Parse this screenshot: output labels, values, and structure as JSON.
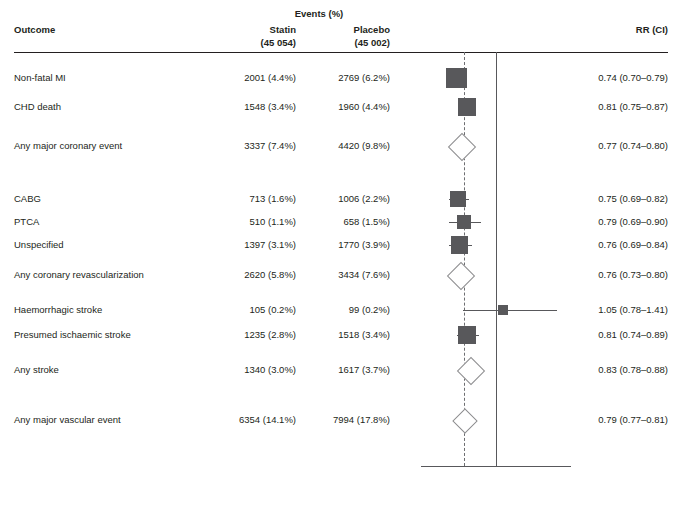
{
  "header": {
    "events_group": "Events (%)",
    "outcome_col": "Outcome",
    "statin_col": "Statin",
    "statin_n": "(45 054)",
    "placebo_col": "Placebo",
    "placebo_n": "(45 002)",
    "rr_col": "RR (CI)"
  },
  "axis": {
    "ticks": [
      "0.5",
      "1.0",
      "1.5"
    ],
    "tick_values": [
      0.5,
      1.0,
      1.5
    ],
    "minor_tick_values": [
      0.75,
      1.25
    ],
    "left_label_line1": "Statin",
    "left_label_line2": "better",
    "right_label_line1": "Placebo",
    "right_label_line2": "better",
    "effect_prefix": "Effect ",
    "effect_p": "P",
    "effect_value": " < 0.0001"
  },
  "colors": {
    "marker": "#58585b",
    "diamond_stroke": "#8c8c8e",
    "reference_line": "#58585b",
    "dashed_line": "#6d6e71",
    "text": "#231f20"
  },
  "chart_data": {
    "type": "forest",
    "title": "Events (%)",
    "xlabel": "",
    "ylabel": "",
    "xlim": [
      0.5,
      1.5
    ],
    "xscale": "linear",
    "reference_line": 1.0,
    "pooled_line": 0.79,
    "grid": false,
    "legend": "none",
    "columns": [
      "Outcome",
      "Statin (45 054)",
      "Placebo (45 002)",
      "RR (CI)"
    ],
    "rows": [
      {
        "outcome": "Non-fatal MI",
        "statin": "2001 (4.4%)",
        "placebo": "2769 (6.2%)",
        "rr_text": "0.74 (0.70–0.79)",
        "rr": 0.74,
        "lo": 0.7,
        "hi": 0.79,
        "marker": "square",
        "weight": 10,
        "y": 78
      },
      {
        "outcome": "CHD death",
        "statin": "1548 (3.4%)",
        "placebo": "1960 (4.4%)",
        "rr_text": "0.81 (0.75–0.87)",
        "rr": 0.81,
        "lo": 0.75,
        "hi": 0.87,
        "marker": "square",
        "weight": 8,
        "y": 107
      },
      {
        "outcome": "Any major coronary event",
        "statin": "3337 (7.4%)",
        "placebo": "4420 (9.8%)",
        "rr_text": "0.77 (0.74–0.80)",
        "rr": 0.77,
        "lo": 0.74,
        "hi": 0.8,
        "marker": "diamond",
        "weight": 0,
        "y": 146
      },
      {
        "outcome": "CABG",
        "statin": "713 (1.6%)",
        "placebo": "1006 (2.2%)",
        "rr_text": "0.75 (0.69–0.82)",
        "rr": 0.75,
        "lo": 0.69,
        "hi": 0.82,
        "marker": "square",
        "weight": 7,
        "y": 199
      },
      {
        "outcome": "PTCA",
        "statin": "510 (1.1%)",
        "placebo": "658 (1.5%)",
        "rr_text": "0.79 (0.69–0.90)",
        "rr": 0.79,
        "lo": 0.69,
        "hi": 0.9,
        "marker": "square",
        "weight": 5,
        "y": 222
      },
      {
        "outcome": "Unspecified",
        "statin": "1397 (3.1%)",
        "placebo": "1770 (3.9%)",
        "rr_text": "0.76 (0.69–0.84)",
        "rr": 0.76,
        "lo": 0.69,
        "hi": 0.84,
        "marker": "square",
        "weight": 8,
        "y": 245
      },
      {
        "outcome": "Any coronary revascularization",
        "statin": "2620 (5.8%)",
        "placebo": "3434 (7.6%)",
        "rr_text": "0.76 (0.73–0.80)",
        "rr": 0.76,
        "lo": 0.73,
        "hi": 0.8,
        "marker": "diamond",
        "weight": 0,
        "y": 275
      },
      {
        "outcome": "Haemorrhagic stroke",
        "statin": "105 (0.2%)",
        "placebo": "99 (0.2%)",
        "rr_text": "1.05 (0.78–1.41)",
        "rr": 1.05,
        "lo": 0.78,
        "hi": 1.41,
        "marker": "square",
        "weight": 3,
        "y": 310
      },
      {
        "outcome": "Presumed ischaemic stroke",
        "statin": "1235 (2.8%)",
        "placebo": "1518 (3.4%)",
        "rr_text": "0.81 (0.74–0.89)",
        "rr": 0.81,
        "lo": 0.74,
        "hi": 0.89,
        "marker": "square",
        "weight": 8,
        "y": 335
      },
      {
        "outcome": "Any stroke",
        "statin": "1340 (3.0%)",
        "placebo": "1617 (3.7%)",
        "rr_text": "0.83 (0.78–0.88)",
        "rr": 0.83,
        "lo": 0.78,
        "hi": 0.88,
        "marker": "diamond",
        "weight": 0,
        "y": 370
      },
      {
        "outcome": "Any major vascular event",
        "statin": "6354 (14.1%)",
        "placebo": "7994 (17.8%)",
        "rr_text": "0.79 (0.77–0.81)",
        "rr": 0.79,
        "lo": 0.77,
        "hi": 0.81,
        "marker": "diamond",
        "weight": 0,
        "y": 420
      }
    ]
  }
}
